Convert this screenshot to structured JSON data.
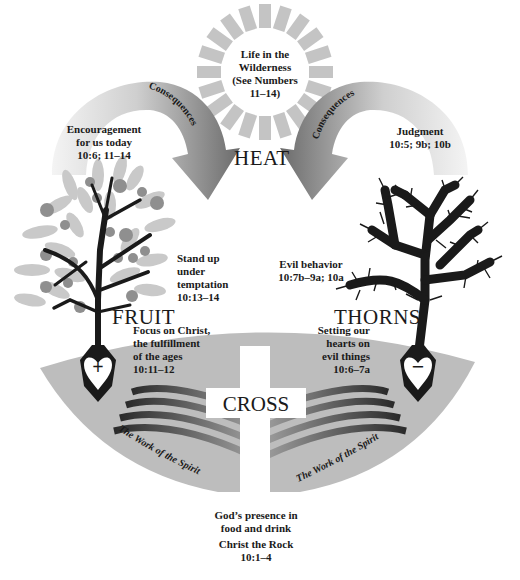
{
  "colors": {
    "background": "#ffffff",
    "ground": "#bdbdbd",
    "sun_rays": "#c4c4c4",
    "arrow_dark": "#6b6b6b",
    "arrow_light": "#d6d6d6",
    "leaf": "#c9c9c9",
    "fruit": "#8f8f8f",
    "trunk": "#1a1a1a",
    "text": "#1a1a1a"
  },
  "sun": {
    "label_line1": "Life in the",
    "label_line2": "Wilderness",
    "label_line3": "(See Numbers",
    "label_line4": "11–14)"
  },
  "heat": {
    "label": "HEAT"
  },
  "left_arrow": {
    "label": "Consequences",
    "text_line1": "Encouragement",
    "text_line2": "for us today",
    "text_line3": "10:6; 11–14"
  },
  "right_arrow": {
    "label": "Consequences",
    "text_line1": "Judgment",
    "text_line2": "10:5; 9b; 10b"
  },
  "fruit_tree": {
    "title": "FRUIT",
    "side_line1": "Stand up",
    "side_line2": "under",
    "side_line3": "temptation",
    "side_line4": "10:13–14",
    "root_line1": "Focus on Christ,",
    "root_line2": "the fulfillment",
    "root_line3": "of the ages",
    "root_line4": "10:11–12",
    "heart_symbol": "+"
  },
  "thorn_tree": {
    "title": "THORNS",
    "side_line1": "Evil behavior",
    "side_line2": "10:7b–9a; 10a",
    "root_line1": "Setting our",
    "root_line2": "hearts on",
    "root_line3": "evil things",
    "root_line4": "10:6–7a",
    "heart_symbol": "−"
  },
  "cross": {
    "label": "CROSS"
  },
  "spirit": {
    "left_label": "The Work of the Spirit",
    "right_label": "The Work of the Spirit"
  },
  "bottom": {
    "line1": "God’s presence in",
    "line2": "food and drink",
    "line3": "Christ the Rock",
    "line4": "10:1–4"
  }
}
